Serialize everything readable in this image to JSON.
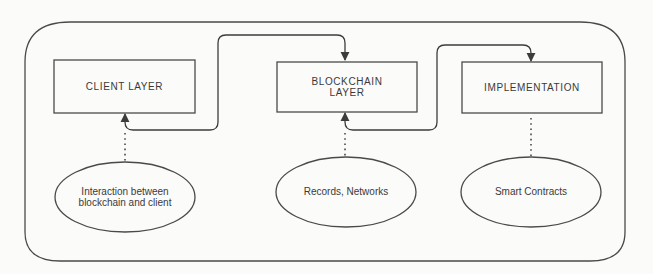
{
  "diagram": {
    "type": "layered-architecture",
    "layers": [
      {
        "id": "client",
        "label": "CLIENT LAYER",
        "description": "Interaction between blockchain and client"
      },
      {
        "id": "blockchain",
        "label": "BLOCKCHAIN LAYER",
        "label_lines": [
          "BLOCKCHAIN",
          "LAYER"
        ],
        "description": "Records, Networks"
      },
      {
        "id": "implementation",
        "label": "IMPLEMENTATION",
        "description": "Smart Contracts"
      }
    ],
    "connections": [
      {
        "from": "client",
        "to": "blockchain",
        "style": "solid-arrow"
      },
      {
        "from": "blockchain",
        "to": "implementation",
        "style": "solid-arrow"
      },
      {
        "from": "client-description",
        "to": "client",
        "style": "dotted"
      },
      {
        "from": "blockchain-description",
        "to": "blockchain",
        "style": "dotted"
      },
      {
        "from": "implementation-description",
        "to": "implementation",
        "style": "dotted"
      }
    ],
    "colors": {
      "stroke": "#4a4a4a",
      "text": "#3a3a3a",
      "background": "#fbfbfa"
    }
  },
  "boxes": {
    "client": "CLIENT LAYER",
    "blockchain_line1": "BLOCKCHAIN",
    "blockchain_line2": "LAYER",
    "implementation": "IMPLEMENTATION"
  },
  "ellipses": {
    "client_line1": "Interaction between",
    "client_line2": "blockchain and client",
    "blockchain": "Records, Networks",
    "implementation": "Smart Contracts"
  }
}
